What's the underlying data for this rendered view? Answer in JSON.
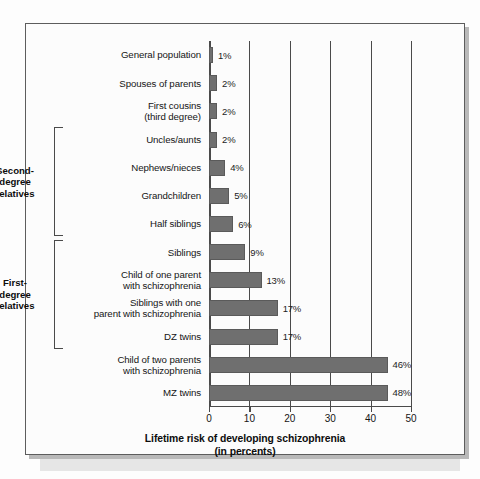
{
  "chart_data": {
    "type": "bar",
    "orientation": "horizontal",
    "title": "",
    "xlabel": "Lifetime risk of developing schizophrenia\n(in percents)",
    "ylabel": "",
    "xlim": [
      0,
      50
    ],
    "xticks": [
      0,
      10,
      20,
      30,
      40,
      50
    ],
    "xtick_labels": [
      "0",
      "10",
      "20",
      "30",
      "40",
      "50"
    ],
    "grid": "vertical",
    "legend": "none",
    "bar_color": "#6f6f6f",
    "categories": [
      "General population",
      "Spouses of parents",
      "First cousins\n(third degree)",
      "Uncles/aunts",
      "Nephews/nieces",
      "Grandchildren",
      "Half siblings",
      "Siblings",
      "Child of one parent\nwith schizophrenia",
      "Siblings with one\nparent with schizophrenia",
      "DZ twins",
      "Child of two parents\nwith schizophrenia",
      "MZ twins"
    ],
    "values": [
      1,
      2,
      2,
      2,
      4,
      5,
      6,
      9,
      13,
      17,
      17,
      46,
      48
    ],
    "value_labels": [
      "1%",
      "2%",
      "2%",
      "2%",
      "4%",
      "5%",
      "6%",
      "9%",
      "13%",
      "17%",
      "17%",
      "46%",
      "48%"
    ],
    "groups": [
      {
        "label": "Second-\ndegree\nrelatives",
        "first_index": 3,
        "last_index": 6
      },
      {
        "label": "First-\ndegree\nrelatives",
        "first_index": 7,
        "last_index": 10
      }
    ]
  }
}
